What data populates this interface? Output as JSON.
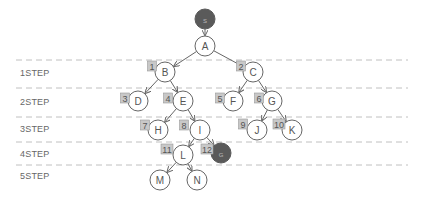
{
  "steps": [
    {
      "label": "1STEP",
      "y": 74
    },
    {
      "label": "2STEP",
      "y": 103
    },
    {
      "label": "3STEP",
      "y": 130
    },
    {
      "label": "4STEP",
      "y": 155
    },
    {
      "label": "5STEP",
      "y": 177
    }
  ],
  "divider_ys": [
    60,
    88,
    117,
    142,
    165
  ],
  "colors": {
    "line": "#c0c0c0",
    "node_stroke": "#666666",
    "dark_node": "#5a5a5a",
    "badge_fill": "#c8c8c8",
    "badge_stroke": "#999999",
    "edge": "#666666",
    "text": "#555555"
  },
  "nodes": [
    {
      "id": "S",
      "label": "S",
      "x": 205,
      "y": 19,
      "dark": true
    },
    {
      "id": "A",
      "label": "A",
      "x": 205,
      "y": 46
    },
    {
      "id": "B",
      "label": "B",
      "x": 165,
      "y": 72
    },
    {
      "id": "C",
      "label": "C",
      "x": 253,
      "y": 72
    },
    {
      "id": "D",
      "label": "D",
      "x": 138,
      "y": 101
    },
    {
      "id": "E",
      "label": "E",
      "x": 183,
      "y": 101
    },
    {
      "id": "F",
      "label": "F",
      "x": 233,
      "y": 101
    },
    {
      "id": "G",
      "label": "G",
      "x": 272,
      "y": 101
    },
    {
      "id": "H",
      "label": "H",
      "x": 158,
      "y": 130
    },
    {
      "id": "I",
      "label": "I",
      "x": 200,
      "y": 130
    },
    {
      "id": "J",
      "label": "J",
      "x": 257,
      "y": 130
    },
    {
      "id": "K",
      "label": "K",
      "x": 292,
      "y": 130
    },
    {
      "id": "L",
      "label": "L",
      "x": 183,
      "y": 155
    },
    {
      "id": "GOAL",
      "label": "G",
      "x": 221,
      "y": 153,
      "dark": true
    },
    {
      "id": "M",
      "label": "M",
      "x": 160,
      "y": 180
    },
    {
      "id": "N",
      "label": "N",
      "x": 197,
      "y": 180
    }
  ],
  "edges": [
    [
      "S",
      "A"
    ],
    [
      "A",
      "B"
    ],
    [
      "A",
      "C"
    ],
    [
      "B",
      "D"
    ],
    [
      "B",
      "E"
    ],
    [
      "C",
      "F"
    ],
    [
      "C",
      "G"
    ],
    [
      "E",
      "H"
    ],
    [
      "E",
      "I"
    ],
    [
      "G",
      "J"
    ],
    [
      "G",
      "K"
    ],
    [
      "I",
      "L"
    ],
    [
      "I",
      "GOAL"
    ],
    [
      "L",
      "M"
    ],
    [
      "L",
      "N"
    ]
  ],
  "badges": [
    {
      "num": "1",
      "x": 152,
      "y": 66
    },
    {
      "num": "2",
      "x": 241,
      "y": 66
    },
    {
      "num": "3",
      "x": 125,
      "y": 98
    },
    {
      "num": "4",
      "x": 168,
      "y": 98
    },
    {
      "num": "5",
      "x": 220,
      "y": 98
    },
    {
      "num": "6",
      "x": 259,
      "y": 98
    },
    {
      "num": "7",
      "x": 145,
      "y": 125
    },
    {
      "num": "8",
      "x": 184,
      "y": 125
    },
    {
      "num": "9",
      "x": 243,
      "y": 124
    },
    {
      "num": "10",
      "x": 279,
      "y": 124
    },
    {
      "num": "11",
      "x": 167,
      "y": 149
    },
    {
      "num": "12",
      "x": 207,
      "y": 149
    }
  ]
}
